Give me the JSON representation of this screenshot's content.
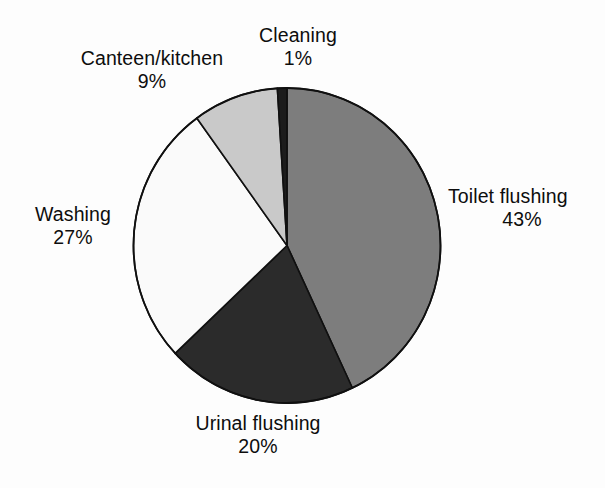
{
  "figure": {
    "background_color": "#fdfdfd",
    "outline_color": "#101010"
  },
  "chart_data": {
    "type": "pie",
    "title": "",
    "subtitle": "",
    "xlabel": "",
    "ylabel": "",
    "grid": false,
    "legend_position": "none",
    "label_style": "outside-callout-text",
    "start_angle_deg": 0,
    "direction": "clockwise",
    "units": "percent",
    "total": 100,
    "categories": [
      "Toilet flushing",
      "Urinal flushing",
      "Washing",
      "Canteen/kitchen",
      "Cleaning"
    ],
    "values": [
      43,
      20,
      27,
      9,
      1
    ],
    "slices": [
      {
        "label": "Toilet flushing",
        "value": 43,
        "value_text": "43%",
        "color": "#7d7d7d",
        "start_deg": 0,
        "end_deg": 154.8
      },
      {
        "label": "Urinal flushing",
        "value": 20,
        "value_text": "20%",
        "color": "#2b2b2b",
        "start_deg": 154.8,
        "end_deg": 226.8
      },
      {
        "label": "Washing",
        "value": 27,
        "value_text": "27%",
        "color": "#fafafa",
        "start_deg": 226.8,
        "end_deg": 324.0
      },
      {
        "label": "Canteen/kitchen",
        "value": 9,
        "value_text": "9%",
        "color": "#c9c9c9",
        "start_deg": 324.0,
        "end_deg": 356.4
      },
      {
        "label": "Cleaning",
        "value": 1,
        "value_text": "1%",
        "color": "#1c1c1c",
        "start_deg": 356.4,
        "end_deg": 360.0
      }
    ]
  },
  "labels": {
    "cleaning": {
      "name": "Cleaning",
      "percent": "1%"
    },
    "canteen": {
      "name": "Canteen/kitchen",
      "percent": "9%"
    },
    "toilet": {
      "name": "Toilet flushing",
      "percent": "43%"
    },
    "washing": {
      "name": "Washing",
      "percent": "27%"
    },
    "urinal": {
      "name": "Urinal flushing",
      "percent": "20%"
    }
  }
}
